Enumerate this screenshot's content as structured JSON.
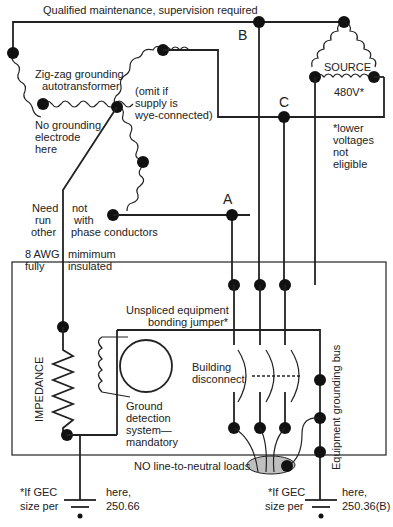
{
  "diagram": {
    "top_label": "Qualified maintenance, supervision required",
    "phase_labels": {
      "a": "A",
      "b": "B",
      "c": "C"
    },
    "source": {
      "label": "SOURCE",
      "voltage": "480V*"
    },
    "source_note": [
      "*lower",
      "voltages",
      "not",
      "eligible"
    ],
    "zigzag_label": [
      "Zig-zag grounding",
      "autotransformer"
    ],
    "omit_note": [
      "(omit if",
      "supply is",
      "wye-connected)"
    ],
    "no_electrode_note": [
      "No grounding",
      "electrode",
      "here"
    ],
    "need_run_left": [
      "Need",
      "run",
      "other"
    ],
    "need_run_right": [
      "not",
      "with",
      "phase conductors"
    ],
    "awg_left": [
      "8 AWG",
      "fully"
    ],
    "awg_right": [
      "mimimum",
      "insulated"
    ],
    "jumper_label": [
      "Unspliced equipment",
      "bonding jumper*"
    ],
    "impedance_label": "IMPEDANCE",
    "ground_detection_label": [
      "Ground",
      "detection",
      "system—",
      "mandatory"
    ],
    "building_disconnect_label": [
      "Building",
      "disconnect"
    ],
    "equipment_bus_label": "Equipment grounding bus",
    "no_loads_label": "NO line-to-neutral loads",
    "gec_left": {
      "left": [
        "*If GEC",
        "size per"
      ],
      "right": [
        "here,",
        "250.66"
      ]
    },
    "gec_right": {
      "left": [
        "*If GEC",
        "size per"
      ],
      "right": [
        "here,",
        "250.36(B)"
      ]
    }
  }
}
